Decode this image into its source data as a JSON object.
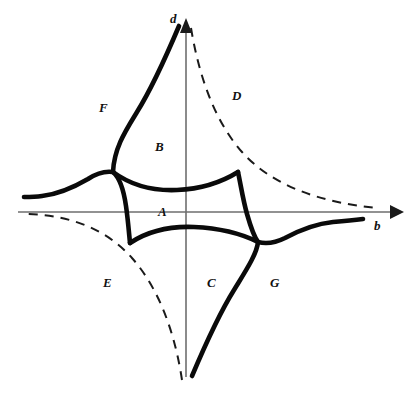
{
  "figure": {
    "background_color": "#ffffff",
    "width": 415,
    "height": 401,
    "colors": {
      "solid_curve": "#0a0a0a",
      "dashed_curve": "#1a1a1a",
      "axis": "#6e6e6e",
      "label": "#111111"
    }
  },
  "axes": {
    "horizontal": {
      "label": "b",
      "arrow": "right",
      "y_pixel": 212,
      "x_start": 18,
      "x_end": 397
    },
    "vertical": {
      "label": "d",
      "arrow": "up",
      "x_pixel": 186,
      "y_start": 375,
      "y_end": 24
    },
    "origin": {
      "x": 186,
      "y": 212
    }
  },
  "regions": [
    {
      "id": "A",
      "label": "A",
      "x": 158,
      "y": 205
    },
    {
      "id": "B",
      "label": "B",
      "x": 155,
      "y": 140
    },
    {
      "id": "C",
      "label": "C",
      "x": 207,
      "y": 276
    },
    {
      "id": "D",
      "label": "D",
      "x": 232,
      "y": 89
    },
    {
      "id": "E",
      "label": "E",
      "x": 103,
      "y": 276
    },
    {
      "id": "F",
      "label": "F",
      "x": 99,
      "y": 101
    },
    {
      "id": "G",
      "label": "G",
      "x": 270,
      "y": 276
    }
  ],
  "curves": [
    {
      "name": "upper-left-solid-branch",
      "style": "solid"
    },
    {
      "name": "lower-right-solid-branch",
      "style": "solid"
    },
    {
      "name": "inner-left-solid-edge",
      "style": "solid"
    },
    {
      "name": "inner-right-solid-edge",
      "style": "solid"
    },
    {
      "name": "inner-top-solid-edge",
      "style": "solid"
    },
    {
      "name": "inner-bottom-solid-edge",
      "style": "solid"
    },
    {
      "name": "upper-right-dashed-hyperbola",
      "style": "dashed"
    },
    {
      "name": "lower-left-dashed-hyperbola",
      "style": "dashed"
    }
  ]
}
